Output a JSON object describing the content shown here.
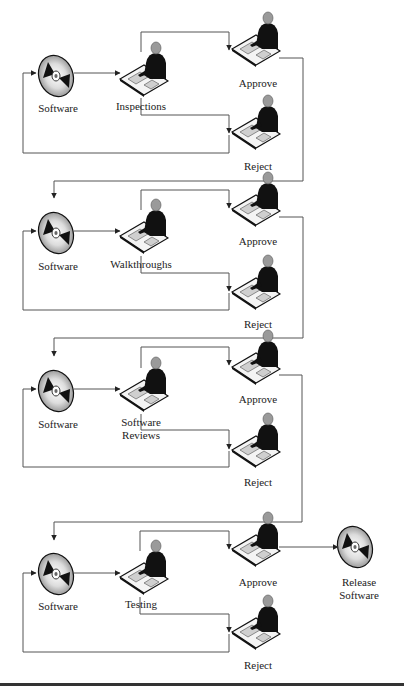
{
  "diagram": {
    "title_visible": false,
    "stages": [
      {
        "id": "inspections",
        "input_label": "Software",
        "process_label": "Inspections",
        "approve_label": "Approve",
        "reject_label": "Reject",
        "y": 0
      },
      {
        "id": "walkthroughs",
        "input_label": "Software",
        "process_label": "Walkthroughs",
        "approve_label": "Approve",
        "reject_label": "Reject",
        "y": 165
      },
      {
        "id": "software-reviews",
        "input_label": "Software",
        "process_label": "Software\nReviews",
        "approve_label": "Approve",
        "reject_label": "Reject",
        "y": 322
      },
      {
        "id": "testing",
        "input_label": "Software",
        "process_label": "Testing",
        "approve_label": "Approve",
        "reject_label": "Reject",
        "y": 490
      }
    ],
    "final_output_label": "Release\nSoftware",
    "colors": {
      "line": "#555555",
      "figure": "#111111",
      "head": "#9a9a9a",
      "disc_light": "#e8e8e8",
      "disc_dark": "#111111",
      "rule": "#333333"
    }
  }
}
